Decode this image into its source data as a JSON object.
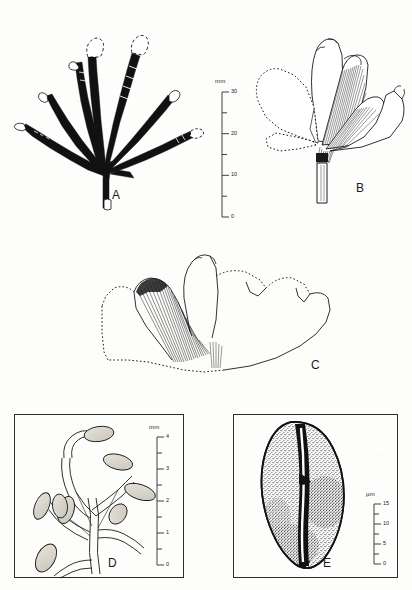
{
  "figure": {
    "type": "scientific-plate",
    "background_color": "#fdfdfc",
    "ink_color": "#111111",
    "panel_count": 5
  },
  "panels": [
    {
      "id": "A",
      "label": "A",
      "label_x": 112,
      "label_y": 196,
      "subject": "dichotomously branched strap-shaped frond with black infilled segments",
      "framed": false,
      "segment_count": 8
    },
    {
      "id": "B",
      "label": "B",
      "label_x": 356,
      "label_y": 186,
      "subject": "fan-shaped ginkgoalean leaf with radiating striate veins and dotted margin",
      "framed": false
    },
    {
      "id": "C",
      "label": "C",
      "label_x": 311,
      "label_y": 366,
      "subject": "large lobed fan-shaped leaf outline with striate vein sector",
      "framed": false
    },
    {
      "id": "D",
      "label": "D",
      "label_x": 109,
      "label_y": 566,
      "subject": "branched axis bearing stalked ovoid sporangia / ovules",
      "framed": true,
      "frame": {
        "x": 14,
        "y": 414,
        "w": 170,
        "h": 164
      }
    },
    {
      "id": "E",
      "label": "E",
      "label_x": 325,
      "label_y": 566,
      "subject": "monosulcate pollen grain, stippled exine with central sulcus",
      "framed": true,
      "frame": {
        "x": 233,
        "y": 414,
        "w": 165,
        "h": 164
      }
    }
  ],
  "scalebars": [
    {
      "id": "scale-ab",
      "unit": "mm",
      "unit_x": 215,
      "unit_y": 82,
      "axis_x": 222,
      "axis_top_y": 92,
      "axis_bottom_y": 217,
      "value_max": 30,
      "value_min": 0,
      "major_ticks": [
        {
          "value": 30,
          "label": "30"
        },
        {
          "value": 20,
          "label": "20"
        },
        {
          "value": 10,
          "label": "10"
        },
        {
          "value": 0,
          "label": "0"
        }
      ],
      "minor_ticks": [
        25,
        15,
        5
      ],
      "applies_to": [
        "A",
        "B",
        "C"
      ]
    },
    {
      "id": "scale-d",
      "unit": "mm",
      "unit_x": 149,
      "unit_y": 428,
      "axis_x": 157,
      "axis_top_y": 437,
      "axis_bottom_y": 565,
      "value_max": 4,
      "value_min": 0,
      "major_ticks": [
        {
          "value": 4,
          "label": "4"
        },
        {
          "value": 3,
          "label": "3"
        },
        {
          "value": 2,
          "label": "2"
        },
        {
          "value": 1,
          "label": "1"
        },
        {
          "value": 0,
          "label": "0"
        }
      ],
      "minor_ticks": [
        3.5,
        2.5,
        1.5,
        0.5
      ],
      "applies_to": [
        "D"
      ]
    },
    {
      "id": "scale-e",
      "unit": "µm",
      "unit_x": 366,
      "unit_y": 495,
      "axis_x": 374,
      "axis_top_y": 504,
      "axis_bottom_y": 564,
      "value_max": 15,
      "value_min": 0,
      "major_ticks": [
        {
          "value": 15,
          "label": "15"
        },
        {
          "value": 10,
          "label": "10"
        },
        {
          "value": 5,
          "label": "5"
        },
        {
          "value": 0,
          "label": "0"
        }
      ],
      "minor_ticks": [
        12.5,
        7.5,
        2.5
      ],
      "applies_to": [
        "E"
      ]
    }
  ]
}
